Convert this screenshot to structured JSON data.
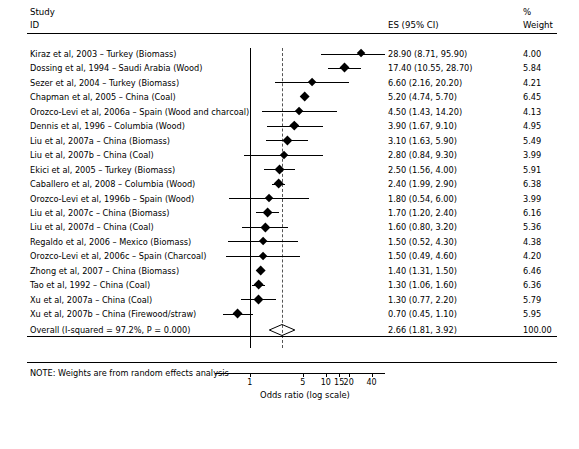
{
  "header": {
    "study": "Study",
    "id": "ID",
    "es": "ES (95% CI)",
    "percent": "%",
    "weight": "Weight"
  },
  "note": "NOTE: Weights are from random effects analysis",
  "chart_data": {
    "type": "forest",
    "title": "",
    "xlabel": "Odds ratio (log scale)",
    "ylabel": "",
    "xscale": "log",
    "xlim": [
      0.35,
      60
    ],
    "ticks": [
      1,
      5,
      10,
      15,
      20,
      40
    ],
    "ticklabels": [
      "1",
      "5",
      "10",
      "15",
      "20",
      "40"
    ],
    "reference_line": 1,
    "summary_line": 2.66,
    "grid": false,
    "rows": [
      {
        "label": "Kiraz et al, 2003 – Turkey (Biomass)",
        "es": 28.9,
        "lo": 8.71,
        "hi": 95.9,
        "es_text": "28.90 (8.71, 95.90)",
        "weight": "4.00"
      },
      {
        "label": "Dossing et al, 1994 – Saudi Arabia (Wood)",
        "es": 17.4,
        "lo": 10.55,
        "hi": 28.7,
        "es_text": "17.40 (10.55, 28.70)",
        "weight": "5.84"
      },
      {
        "label": "Sezer et al, 2004 – Turkey (Biomass)",
        "es": 6.6,
        "lo": 2.16,
        "hi": 20.2,
        "es_text": "6.60 (2.16, 20.20)",
        "weight": "4.21"
      },
      {
        "label": "Chapman et al, 2005 – China (Coal)",
        "es": 5.2,
        "lo": 4.74,
        "hi": 5.7,
        "es_text": "5.20 (4.74, 5.70)",
        "weight": "6.45"
      },
      {
        "label": "Orozco-Levi et al, 2006a – Spain (Wood and charcoal)",
        "es": 4.5,
        "lo": 1.43,
        "hi": 14.2,
        "es_text": "4.50 (1.43, 14.20)",
        "weight": "4.13"
      },
      {
        "label": "Dennis et al, 1996 – Columbia (Wood)",
        "es": 3.9,
        "lo": 1.67,
        "hi": 9.1,
        "es_text": "3.90 (1.67, 9.10)",
        "weight": "4.95"
      },
      {
        "label": "Liu et al, 2007a – China (Biomass)",
        "es": 3.1,
        "lo": 1.63,
        "hi": 5.9,
        "es_text": "3.10 (1.63, 5.90)",
        "weight": "5.49"
      },
      {
        "label": "Liu et al, 2007b – China (Coal)",
        "es": 2.8,
        "lo": 0.84,
        "hi": 9.3,
        "es_text": "2.80 (0.84, 9.30)",
        "weight": "3.99"
      },
      {
        "label": "Ekici et al, 2005 – Turkey (Biomass)",
        "es": 2.5,
        "lo": 1.56,
        "hi": 4.0,
        "es_text": "2.50 (1.56, 4.00)",
        "weight": "5.91"
      },
      {
        "label": "Caballero et al, 2008 – Columbia (Wood)",
        "es": 2.4,
        "lo": 1.99,
        "hi": 2.9,
        "es_text": "2.40 (1.99, 2.90)",
        "weight": "6.38"
      },
      {
        "label": "Orozco-Levi et al, 1996b – Spain (Wood)",
        "es": 1.8,
        "lo": 0.54,
        "hi": 6.0,
        "es_text": "1.80 (0.54, 6.00)",
        "weight": "3.99"
      },
      {
        "label": "Liu et al, 2007c – China (Biomass)",
        "es": 1.7,
        "lo": 1.2,
        "hi": 2.4,
        "es_text": "1.70 (1.20, 2.40)",
        "weight": "6.16"
      },
      {
        "label": "Liu et al, 2007d – China (Coal)",
        "es": 1.6,
        "lo": 0.8,
        "hi": 3.2,
        "es_text": "1.60 (0.80, 3.20)",
        "weight": "5.36"
      },
      {
        "label": "Regaldo et al, 2006 – Mexico (Biomass)",
        "es": 1.5,
        "lo": 0.52,
        "hi": 4.3,
        "es_text": "1.50 (0.52, 4.30)",
        "weight": "4.38"
      },
      {
        "label": "Orozco-Levi et al, 2006c – Spain (Charcoal)",
        "es": 1.5,
        "lo": 0.49,
        "hi": 4.6,
        "es_text": "1.50 (0.49, 4.60)",
        "weight": "4.20"
      },
      {
        "label": "Zhong et al, 2007 – China (Biomass)",
        "es": 1.4,
        "lo": 1.31,
        "hi": 1.5,
        "es_text": "1.40 (1.31, 1.50)",
        "weight": "6.46"
      },
      {
        "label": "Tao et al, 1992 – China (Coal)",
        "es": 1.3,
        "lo": 1.06,
        "hi": 1.6,
        "es_text": "1.30 (1.06, 1.60)",
        "weight": "6.36"
      },
      {
        "label": "Xu et al, 2007a – China (Coal)",
        "es": 1.3,
        "lo": 0.77,
        "hi": 2.2,
        "es_text": "1.30 (0.77, 2.20)",
        "weight": "5.79"
      },
      {
        "label": "Xu et al, 2007b – China (Firewood/straw)",
        "es": 0.7,
        "lo": 0.45,
        "hi": 1.1,
        "es_text": "0.70 (0.45, 1.10)",
        "weight": "5.95"
      }
    ],
    "overall": {
      "label": "Overall  (I-squared = 97.2%, P = 0.000)",
      "es": 2.66,
      "lo": 1.81,
      "hi": 3.92,
      "es_text": "2.66 (1.81, 3.92)",
      "weight": "100.00"
    }
  }
}
